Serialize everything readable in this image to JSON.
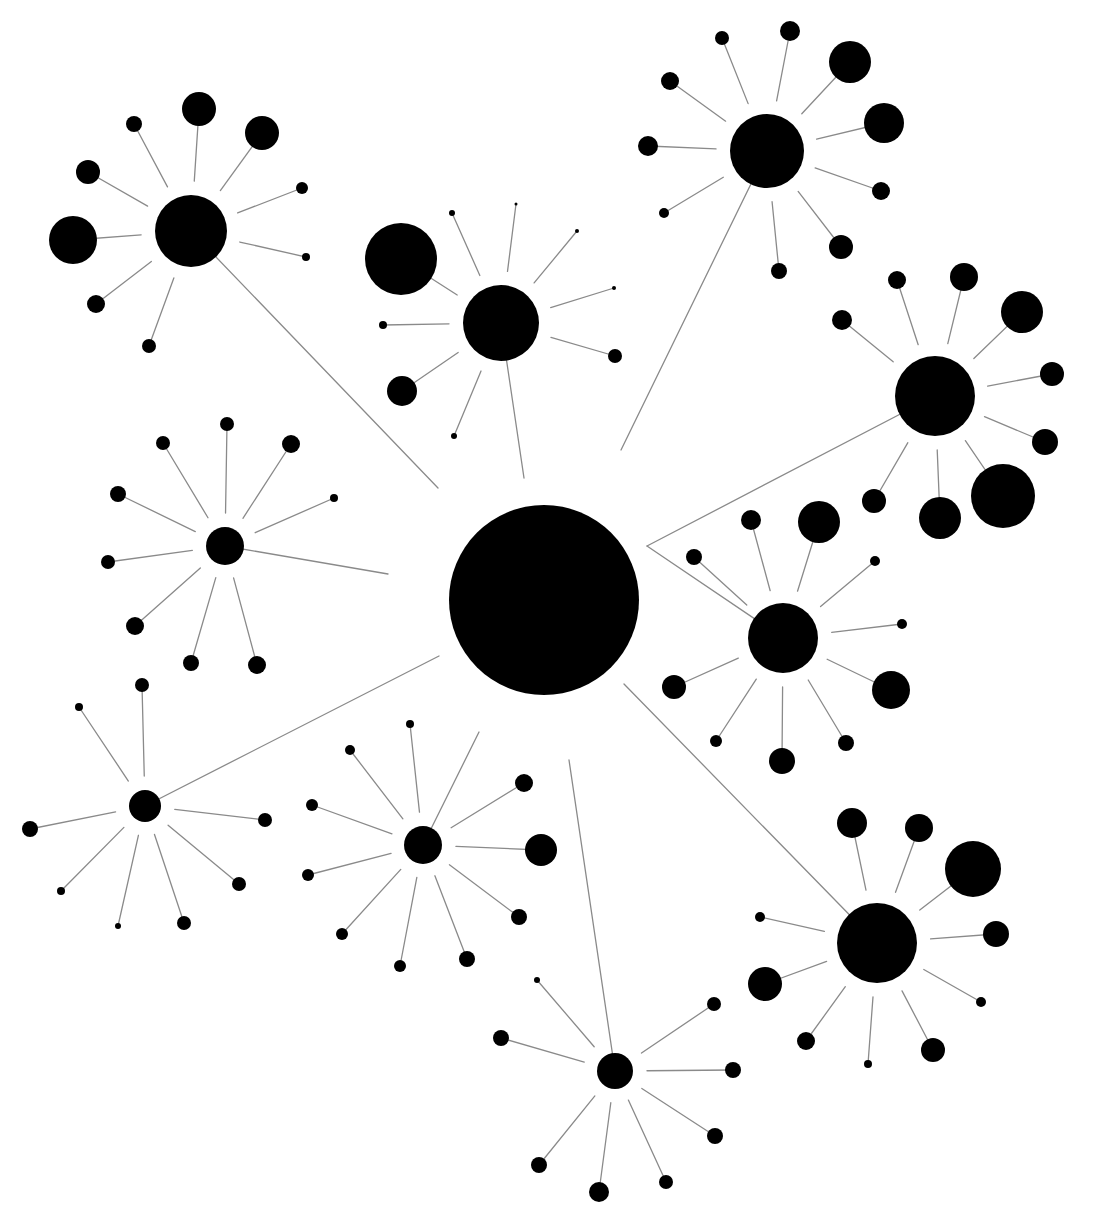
{
  "diagram": {
    "type": "radial-network",
    "width": 1096,
    "height": 1216,
    "colors": {
      "node": "#000000",
      "edge": "#8a8a8a",
      "background": "#ffffff"
    },
    "edge_trim": 0.45,
    "root": {
      "id": "root",
      "x": 544,
      "y": 600,
      "r": 95
    },
    "hubs": [
      {
        "id": "hub-nw",
        "x": 191,
        "y": 231,
        "r": 36,
        "link": [
          438,
          488
        ],
        "leaves": [
          [
            73,
            240,
            24
          ],
          [
            88,
            172,
            12
          ],
          [
            134,
            124,
            8
          ],
          [
            199,
            109,
            17
          ],
          [
            262,
            133,
            17
          ],
          [
            302,
            188,
            6
          ],
          [
            306,
            257,
            4
          ],
          [
            96,
            304,
            9
          ],
          [
            149,
            346,
            7
          ]
        ]
      },
      {
        "id": "hub-n",
        "x": 501,
        "y": 323,
        "r": 38,
        "link": [
          524,
          478
        ],
        "leaves": [
          [
            401,
            259,
            36
          ],
          [
            452,
            213,
            3
          ],
          [
            516,
            204,
            1.5
          ],
          [
            577,
            231,
            2
          ],
          [
            614,
            288,
            2
          ],
          [
            615,
            356,
            7
          ],
          [
            383,
            325,
            4
          ],
          [
            402,
            391,
            15
          ],
          [
            454,
            436,
            3
          ]
        ]
      },
      {
        "id": "hub-ne",
        "x": 767,
        "y": 151,
        "r": 37,
        "link": [
          621,
          450
        ],
        "leaves": [
          [
            670,
            81,
            9
          ],
          [
            722,
            38,
            7
          ],
          [
            790,
            31,
            10
          ],
          [
            850,
            62,
            21
          ],
          [
            884,
            123,
            20
          ],
          [
            881,
            191,
            9
          ],
          [
            841,
            247,
            12
          ],
          [
            779,
            271,
            8
          ],
          [
            664,
            213,
            5
          ],
          [
            648,
            146,
            10
          ]
        ]
      },
      {
        "id": "hub-e",
        "x": 935,
        "y": 396,
        "r": 40,
        "link": [
          647,
          546
        ],
        "leaves": [
          [
            897,
            280,
            9
          ],
          [
            964,
            277,
            14
          ],
          [
            1022,
            312,
            21
          ],
          [
            1052,
            374,
            12
          ],
          [
            1045,
            442,
            13
          ],
          [
            1003,
            496,
            32
          ],
          [
            940,
            518,
            21
          ],
          [
            874,
            501,
            12
          ],
          [
            842,
            320,
            10
          ]
        ]
      },
      {
        "id": "hub-mid-e",
        "x": 783,
        "y": 638,
        "r": 35,
        "link": [
          647,
          546
        ],
        "leaves": [
          [
            751,
            520,
            10
          ],
          [
            819,
            522,
            21
          ],
          [
            875,
            561,
            5
          ],
          [
            902,
            624,
            5
          ],
          [
            891,
            690,
            19
          ],
          [
            846,
            743,
            8
          ],
          [
            782,
            761,
            13
          ],
          [
            716,
            741,
            6
          ],
          [
            674,
            687,
            12
          ],
          [
            694,
            557,
            8
          ]
        ]
      },
      {
        "id": "hub-se",
        "x": 877,
        "y": 943,
        "r": 40,
        "link": [
          624,
          684
        ],
        "leaves": [
          [
            852,
            823,
            15
          ],
          [
            919,
            828,
            14
          ],
          [
            973,
            869,
            28
          ],
          [
            996,
            934,
            13
          ],
          [
            981,
            1002,
            5
          ],
          [
            933,
            1050,
            12
          ],
          [
            868,
            1064,
            4
          ],
          [
            806,
            1041,
            9
          ],
          [
            765,
            984,
            17
          ],
          [
            760,
            917,
            5
          ]
        ]
      },
      {
        "id": "hub-s",
        "x": 615,
        "y": 1071,
        "r": 18,
        "link": [
          569,
          760
        ],
        "leaves": [
          [
            537,
            980,
            3
          ],
          [
            501,
            1038,
            8
          ],
          [
            714,
            1004,
            7
          ],
          [
            733,
            1070,
            8
          ],
          [
            715,
            1136,
            8
          ],
          [
            666,
            1182,
            7
          ],
          [
            599,
            1192,
            10
          ],
          [
            539,
            1165,
            8
          ]
        ]
      },
      {
        "id": "hub-sw",
        "x": 423,
        "y": 845,
        "r": 19,
        "link": [
          479,
          732
        ],
        "leaves": [
          [
            410,
            724,
            4
          ],
          [
            350,
            750,
            5
          ],
          [
            312,
            805,
            6
          ],
          [
            308,
            875,
            6
          ],
          [
            342,
            934,
            6
          ],
          [
            400,
            966,
            6
          ],
          [
            467,
            959,
            8
          ],
          [
            519,
            917,
            8
          ],
          [
            541,
            850,
            16
          ],
          [
            524,
            783,
            9
          ]
        ]
      },
      {
        "id": "hub-w",
        "x": 145,
        "y": 806,
        "r": 16,
        "link": [
          439,
          656
        ],
        "leaves": [
          [
            79,
            707,
            4
          ],
          [
            142,
            685,
            7
          ],
          [
            30,
            829,
            8
          ],
          [
            61,
            891,
            4
          ],
          [
            118,
            926,
            3
          ],
          [
            184,
            923,
            7
          ],
          [
            239,
            884,
            7
          ],
          [
            265,
            820,
            7
          ]
        ]
      },
      {
        "id": "hub-mw",
        "x": 225,
        "y": 546,
        "r": 19,
        "link": [
          388,
          574
        ],
        "leaves": [
          [
            163,
            443,
            7
          ],
          [
            227,
            424,
            7
          ],
          [
            291,
            444,
            9
          ],
          [
            334,
            498,
            4
          ],
          [
            118,
            494,
            8
          ],
          [
            108,
            562,
            7
          ],
          [
            135,
            626,
            9
          ],
          [
            191,
            663,
            8
          ],
          [
            257,
            665,
            9
          ]
        ]
      }
    ]
  }
}
